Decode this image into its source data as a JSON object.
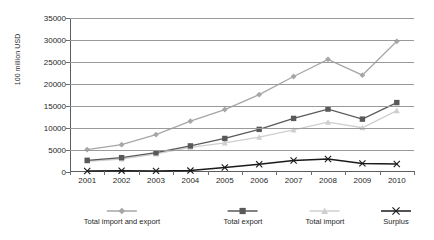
{
  "chart_data": {
    "type": "line",
    "title": "",
    "xlabel": "",
    "ylabel": "100 million USD",
    "x": [
      2001,
      2002,
      2003,
      2004,
      2005,
      2006,
      2007,
      2008,
      2009,
      2010
    ],
    "categories": [
      "2001",
      "2002",
      "2003",
      "2004",
      "2005",
      "2006",
      "2007",
      "2008",
      "2009",
      "2010"
    ],
    "ylim": [
      0,
      35000
    ],
    "ytick_values": [
      0,
      5000,
      10000,
      15000,
      20000,
      25000,
      30000,
      35000
    ],
    "ytick_labels": [
      "0",
      "5000",
      "10000",
      "15000",
      "20000",
      "25000",
      "30000",
      "35000"
    ],
    "grid": true,
    "legend_position": "bottom",
    "series": [
      {
        "name": "Total import and export",
        "color": "#a6a6a6",
        "marker": "diamond",
        "values": [
          5100,
          6200,
          8500,
          11550,
          14200,
          17600,
          21700,
          25600,
          22000,
          29700
        ]
      },
      {
        "name": "Total export",
        "color": "#595959",
        "marker": "square",
        "values": [
          2660,
          3260,
          4380,
          5930,
          7620,
          9690,
          12180,
          14300,
          12020,
          15780
        ]
      },
      {
        "name": "Total import",
        "color": "#cfcfcf",
        "marker": "triangle",
        "values": [
          2440,
          2950,
          4130,
          5610,
          6600,
          7910,
          9560,
          11330,
          10060,
          13950
        ]
      },
      {
        "name": "Surplus",
        "color": "#1a1a1a",
        "marker": "x",
        "values": [
          225,
          305,
          255,
          320,
          1020,
          1780,
          2620,
          2950,
          1960,
          1830
        ]
      }
    ]
  },
  "axis": {
    "y_title": "100 million USD"
  }
}
